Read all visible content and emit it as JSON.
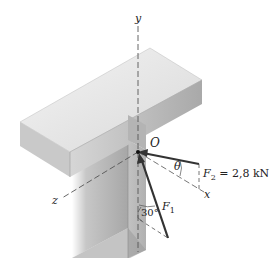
{
  "diagram": {
    "type": "statics-force-diagram",
    "axes": {
      "x": "x",
      "y": "y",
      "z": "z"
    },
    "origin_label": "O",
    "forces": [
      {
        "name": "F",
        "sub": "1",
        "value": ""
      },
      {
        "name": "F",
        "sub": "2",
        "value": "= 2,8 kN"
      }
    ],
    "angles": {
      "theta": "θ",
      "alpha": "30°"
    },
    "colors": {
      "beam_top": "#e6e6e6",
      "beam_front": "#b9b9b9",
      "beam_side": "#cfcfcf",
      "column": "#a8a8a8",
      "force_line": "#333333",
      "axis_dash": "#555555"
    }
  }
}
